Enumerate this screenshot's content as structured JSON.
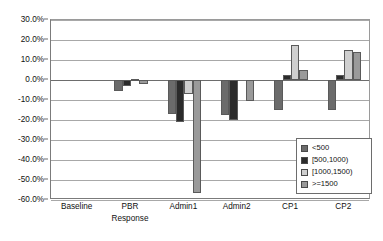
{
  "chart_data": {
    "type": "bar",
    "title": "",
    "xlabel": "Response",
    "ylabel": "",
    "ylim": [
      -60,
      30
    ],
    "ytick_step": 10,
    "grid": true,
    "legend_position": "inside-bottom-right",
    "value_format": "percent",
    "categories": [
      "Baseline",
      "PBR",
      "Admin1",
      "Admin2",
      "CP1",
      "CP2"
    ],
    "ytick_labels": [
      "30.0%",
      "20.0%",
      "10.0%",
      "0.0%",
      "-10.0%",
      "-20.0%",
      "-30.0%",
      "-40.0%",
      "-50.0%",
      "-60.0%"
    ],
    "ytick_values": [
      30,
      20,
      10,
      0,
      -10,
      -20,
      -30,
      -40,
      -50,
      -60
    ],
    "series": [
      {
        "name": "<500",
        "color": "#6b6b6b",
        "values": [
          0,
          -5.5,
          -17.0,
          -17.5,
          -15.0,
          -15.0
        ]
      },
      {
        "name": "[500,1000)",
        "color": "#2b2b2b",
        "values": [
          0,
          -3.0,
          -21.0,
          -20.0,
          2.5,
          2.5
        ]
      },
      {
        "name": "[1000,1500)",
        "color": "#cfcfcf",
        "values": [
          0,
          0.5,
          -7.0,
          0,
          17.5,
          15.0
        ]
      },
      {
        "name": "&gt;=1500",
        "color": "#9a9a9a",
        "values": [
          0,
          -2.0,
          -56.5,
          -10.5,
          5.0,
          14.0
        ]
      }
    ]
  },
  "legend": {
    "items": [
      {
        "label": "<500"
      },
      {
        "label": "[500,1000)"
      },
      {
        "label": "[1000,1500)"
      },
      {
        "label": ">=1500"
      }
    ]
  },
  "axes": {
    "x_title": "Response"
  }
}
